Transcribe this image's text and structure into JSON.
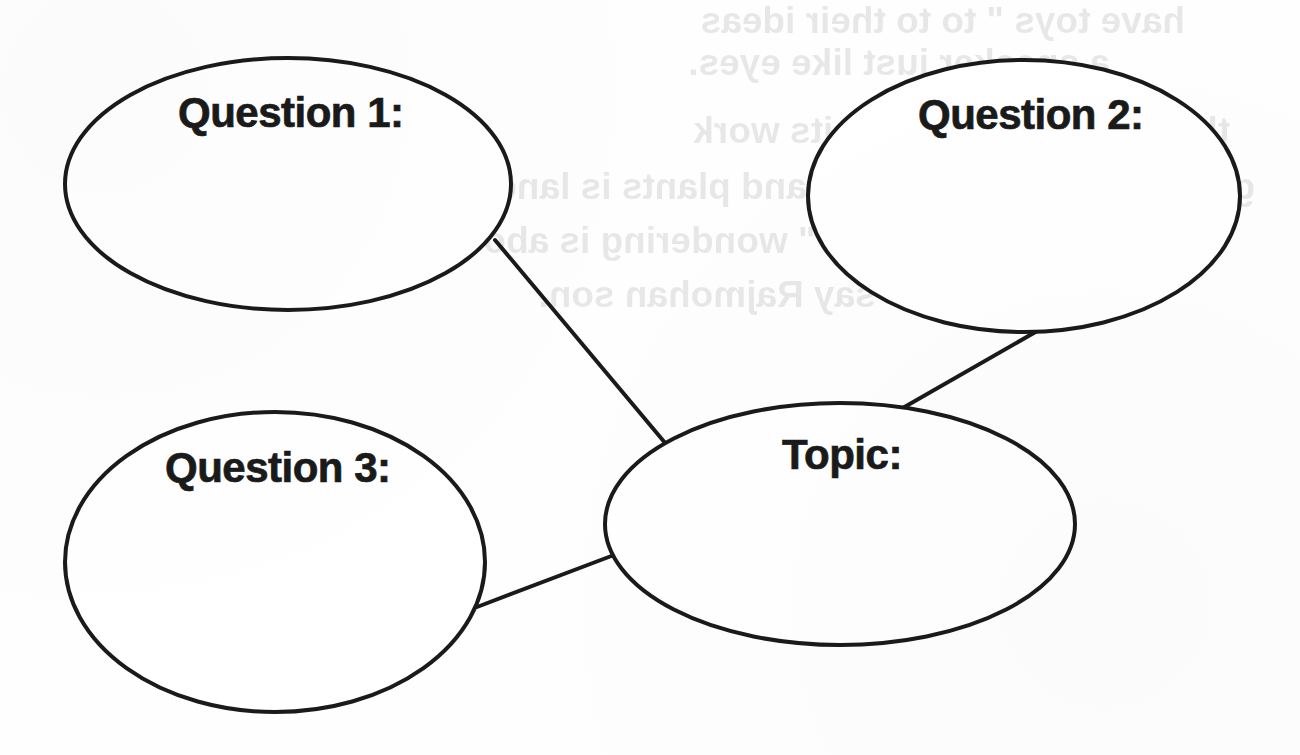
{
  "page": {
    "kind": "concept-map-worksheet",
    "background_color": "#fefefe",
    "ink_color": "#1a1a1a",
    "width": 1300,
    "height": 755
  },
  "diagram": {
    "type": "bubble-map",
    "nodes": [
      {
        "id": "question-1",
        "label": "Question 1:",
        "shape": "ellipse",
        "cx": 288,
        "cy": 184,
        "rx": 223,
        "ry": 126
      },
      {
        "id": "question-2",
        "label": "Question 2:",
        "shape": "ellipse",
        "cx": 1024,
        "cy": 196,
        "rx": 216,
        "ry": 136
      },
      {
        "id": "question-3",
        "label": "Question 3:",
        "shape": "ellipse",
        "cx": 275,
        "cy": 562,
        "rx": 210,
        "ry": 150
      },
      {
        "id": "topic",
        "label": "Topic:",
        "shape": "ellipse",
        "cx": 840,
        "cy": 524,
        "rx": 235,
        "ry": 121
      }
    ],
    "edges": [
      {
        "id": "edge-q1-topic",
        "from": "question-1",
        "to": "topic",
        "x1": 495,
        "y1": 240,
        "x2": 666,
        "y2": 444
      },
      {
        "id": "edge-q2-topic",
        "from": "question-2",
        "to": "topic",
        "x1": 1039,
        "y1": 330,
        "x2": 901,
        "y2": 409
      },
      {
        "id": "edge-q3-topic",
        "from": "question-3",
        "to": "topic",
        "x1": 477,
        "y1": 607,
        "x2": 614,
        "y2": 555
      }
    ],
    "stroke_width": 4
  },
  "bleed_through": {
    "note": "faint mirrored text showing through from reverse side of the paper",
    "lines": [
      "have toys \" to to their ideas",
      "a speaker just like eyes.",
      "the working as a slug, its work",
      "go when the mother lang and  plants is land doing and",
      "sound - the sparks, \" wondering is about of the old pages. \"",
      "who say Rajmohan son."
    ]
  }
}
